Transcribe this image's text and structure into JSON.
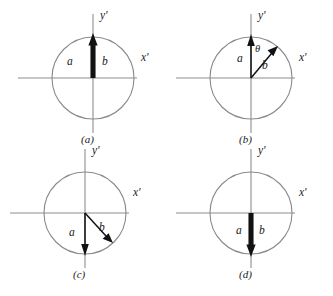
{
  "figure": {
    "panels": [
      {
        "id": "panel-a",
        "caption": "(a)",
        "axis_x_label": "x'",
        "axis_y_label": "y'",
        "vector_a_label": "a",
        "vector_b_label": "b",
        "angle_label": "",
        "vector_a_direction_deg": 90,
        "vector_b_direction_deg": 90,
        "description": "Vectors a and b both point along +y', coincident, angle theta = 0"
      },
      {
        "id": "panel-b",
        "caption": "(b)",
        "axis_x_label": "x'",
        "axis_y_label": "y'",
        "vector_a_label": "a",
        "vector_b_label": "b",
        "angle_label": "θ",
        "vector_a_direction_deg": 90,
        "vector_b_direction_deg": 48,
        "description": "Vector a along +y', vector b rotated clockwise by theta into first quadrant"
      },
      {
        "id": "panel-c",
        "caption": "(c)",
        "axis_x_label": "x'",
        "axis_y_label": "y'",
        "vector_a_label": "a",
        "vector_b_label": "b",
        "angle_label": "",
        "vector_a_direction_deg": 270,
        "vector_b_direction_deg": 315,
        "description": "Vector a along -y', vector b rotated into fourth quadrant at about 45 degrees below +x'"
      },
      {
        "id": "panel-d",
        "caption": "(d)",
        "axis_x_label": "x'",
        "axis_y_label": "y'",
        "vector_a_label": "a",
        "vector_b_label": "b",
        "angle_label": "",
        "vector_a_direction_deg": 270,
        "vector_b_direction_deg": 270,
        "description": "Vectors a and b both point along -y', coincident"
      }
    ],
    "colors": {
      "background": "#ffffff",
      "axis": "#8d8d8d",
      "circle": "#8a8a8a",
      "vector": "#121212",
      "label": "#1a1a1a"
    }
  }
}
